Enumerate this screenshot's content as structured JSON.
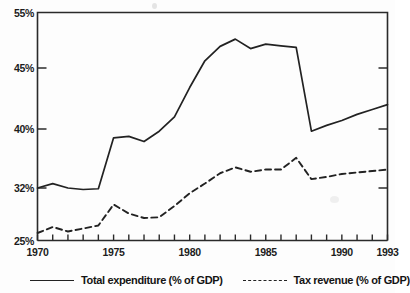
{
  "chart_data": {
    "type": "line",
    "title": "",
    "xlabel": "",
    "ylabel": "",
    "x": [
      1970,
      1971,
      1972,
      1973,
      1974,
      1975,
      1976,
      1977,
      1978,
      1979,
      1980,
      1981,
      1982,
      1983,
      1984,
      1985,
      1986,
      1987,
      1988,
      1989,
      1990,
      1991,
      1992,
      1993
    ],
    "xlim": [
      1970,
      1993
    ],
    "ylim": [
      25,
      55
    ],
    "ytick_labels": [
      "55%",
      "45%",
      "40%",
      "32%",
      "25%"
    ],
    "ytick_values": [
      55,
      45,
      40,
      32,
      25
    ],
    "xtick_labels": [
      "1970",
      "1975",
      "1980",
      "1985",
      "1990",
      "1993"
    ],
    "xtick_values": [
      1970,
      1975,
      1980,
      1985,
      1990,
      1993
    ],
    "xticks_minor_every": 1,
    "grid": false,
    "legend_position": "below",
    "axis_note": "non-linear y spacing as printed",
    "series": [
      {
        "name": "Total expenditure (% of GDP)",
        "style": "solid",
        "color": "#222222",
        "values": [
          32.0,
          32.6,
          32.0,
          31.8,
          31.9,
          38.8,
          39.0,
          38.3,
          39.7,
          41.0,
          43.4,
          46.3,
          48.9,
          50.2,
          48.5,
          49.3,
          49.0,
          48.7,
          39.7,
          40.3,
          40.7,
          41.2,
          41.6,
          42.0
        ]
      },
      {
        "name": "Tax revenue (% of GDP)",
        "style": "dashed",
        "color": "#222222",
        "values": [
          26.0,
          26.8,
          26.2,
          26.6,
          27.0,
          29.8,
          28.6,
          28.0,
          28.1,
          29.6,
          31.3,
          32.6,
          34.0,
          34.8,
          34.2,
          34.5,
          34.5,
          36.1,
          33.2,
          33.5,
          33.9,
          34.1,
          34.3,
          34.5
        ]
      }
    ]
  },
  "legend": {
    "items": [
      {
        "label": "Total expenditure (% of GDP)",
        "style": "solid"
      },
      {
        "label": "Tax revenue (% of GDP)",
        "style": "dashed"
      }
    ]
  }
}
